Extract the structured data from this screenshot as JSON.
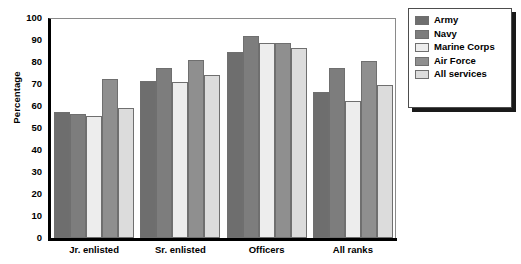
{
  "chart_data": {
    "type": "bar",
    "title": "",
    "xlabel": "",
    "ylabel": "Percentage",
    "ylim": [
      0,
      100
    ],
    "yticks": [
      0,
      10,
      20,
      30,
      40,
      50,
      60,
      70,
      80,
      90,
      100
    ],
    "grid": false,
    "legend_position": "right",
    "categories": [
      "Jr. enlisted",
      "Sr. enlisted",
      "Officers",
      "All ranks"
    ],
    "series": [
      {
        "name": "Army",
        "color": "#6e6e6e",
        "values": [
          57.5,
          71.5,
          84.5,
          66.5
        ]
      },
      {
        "name": "Navy",
        "color": "#7d7d7d",
        "values": [
          56.5,
          77.5,
          92.0,
          77.5
        ]
      },
      {
        "name": "Marine Corps",
        "color": "#ededed",
        "values": [
          55.5,
          71.0,
          88.5,
          62.5
        ]
      },
      {
        "name": "Air Force",
        "color": "#8f8f8f",
        "values": [
          72.5,
          81.0,
          88.5,
          80.5
        ]
      },
      {
        "name": "All services",
        "color": "#dcdcdc",
        "values": [
          59.0,
          74.0,
          86.5,
          69.5
        ]
      }
    ]
  },
  "legend": {
    "items": [
      {
        "label": "Army"
      },
      {
        "label": "Navy"
      },
      {
        "label": "Marine Corps"
      },
      {
        "label": "Air Force"
      },
      {
        "label": "All services"
      }
    ]
  },
  "axis": {
    "y_title": "Percentage"
  },
  "colors": {
    "axis_line": "#000000",
    "frame_line": "#8a8a8a",
    "bar_outline": "#6f6f6f",
    "legend_shadow": "#1a1a1a",
    "background": "#ffffff"
  }
}
